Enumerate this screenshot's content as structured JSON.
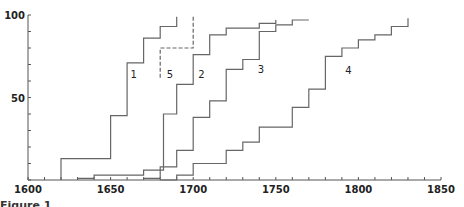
{
  "chart_data": {
    "type": "line",
    "step": true,
    "title": "",
    "xlabel": "",
    "ylabel": "",
    "xlim": [
      1600,
      1850
    ],
    "ylim": [
      0,
      100
    ],
    "x_ticks": [
      1600,
      1650,
      1700,
      1750,
      1800,
      1850
    ],
    "x_minor_step": 10,
    "y_ticks": [
      50,
      100
    ],
    "y_minor_step": 10,
    "grid": false,
    "legend": "inline curve labels",
    "series": [
      {
        "name": "1",
        "style": "solid",
        "points": [
          [
            1620,
            0
          ],
          [
            1620,
            13
          ],
          [
            1650,
            13
          ],
          [
            1650,
            39
          ],
          [
            1660,
            39
          ],
          [
            1660,
            71
          ],
          [
            1670,
            71
          ],
          [
            1670,
            86
          ],
          [
            1680,
            86
          ],
          [
            1680,
            93
          ],
          [
            1690,
            93
          ],
          [
            1690,
            99
          ]
        ],
        "label_pos": [
          1662,
          62
        ]
      },
      {
        "name": "5",
        "style": "dashed",
        "points": [
          [
            1680,
            62
          ],
          [
            1680,
            80
          ],
          [
            1700,
            80
          ],
          [
            1700,
            99
          ]
        ],
        "label_pos": [
          1684,
          62
        ]
      },
      {
        "name": "2",
        "style": "solid",
        "points": [
          [
            1630,
            1
          ],
          [
            1640,
            1
          ],
          [
            1640,
            3
          ],
          [
            1670,
            3
          ],
          [
            1670,
            6
          ],
          [
            1682,
            6
          ],
          [
            1682,
            40
          ],
          [
            1690,
            40
          ],
          [
            1690,
            58
          ],
          [
            1700,
            58
          ],
          [
            1700,
            76
          ],
          [
            1710,
            76
          ],
          [
            1710,
            88
          ],
          [
            1720,
            88
          ],
          [
            1720,
            92
          ],
          [
            1740,
            92
          ],
          [
            1740,
            95
          ],
          [
            1750,
            95
          ],
          [
            1750,
            97
          ]
        ],
        "label_pos": [
          1703,
          62
        ]
      },
      {
        "name": "3",
        "style": "solid",
        "points": [
          [
            1670,
            1
          ],
          [
            1680,
            1
          ],
          [
            1680,
            8
          ],
          [
            1690,
            8
          ],
          [
            1690,
            18
          ],
          [
            1700,
            18
          ],
          [
            1700,
            38
          ],
          [
            1710,
            38
          ],
          [
            1710,
            48
          ],
          [
            1720,
            48
          ],
          [
            1720,
            67
          ],
          [
            1730,
            67
          ],
          [
            1730,
            73
          ],
          [
            1740,
            73
          ],
          [
            1740,
            90
          ],
          [
            1750,
            90
          ],
          [
            1750,
            94
          ],
          [
            1760,
            94
          ],
          [
            1760,
            97
          ],
          [
            1770,
            97
          ]
        ],
        "label_pos": [
          1739,
          65
        ]
      },
      {
        "name": "4",
        "style": "solid",
        "points": [
          [
            1680,
            0
          ],
          [
            1690,
            0
          ],
          [
            1690,
            3
          ],
          [
            1700,
            3
          ],
          [
            1700,
            10
          ],
          [
            1720,
            10
          ],
          [
            1720,
            18
          ],
          [
            1730,
            18
          ],
          [
            1730,
            23
          ],
          [
            1740,
            23
          ],
          [
            1740,
            32
          ],
          [
            1760,
            32
          ],
          [
            1760,
            44
          ],
          [
            1770,
            44
          ],
          [
            1770,
            55
          ],
          [
            1780,
            55
          ],
          [
            1780,
            75
          ],
          [
            1790,
            75
          ],
          [
            1790,
            80
          ],
          [
            1800,
            80
          ],
          [
            1800,
            85
          ],
          [
            1810,
            85
          ],
          [
            1810,
            88
          ],
          [
            1820,
            88
          ],
          [
            1820,
            93
          ],
          [
            1830,
            93
          ],
          [
            1830,
            98
          ]
        ],
        "label_pos": [
          1792,
          64
        ]
      }
    ]
  },
  "caption": "Figure 1. ..."
}
